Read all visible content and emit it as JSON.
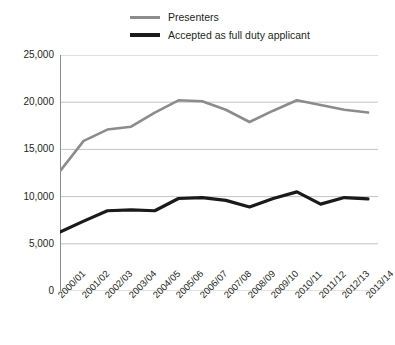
{
  "chart_data": {
    "type": "line",
    "title": "",
    "subtitle": "",
    "xlabel": "",
    "ylabel": "",
    "grid": true,
    "legend_position": "top-center",
    "ylim": [
      0,
      25000
    ],
    "yticks": [
      0,
      5000,
      10000,
      15000,
      20000,
      25000
    ],
    "ytick_labels": [
      "0",
      "5,000",
      "10,000",
      "15,000",
      "20,000",
      "25,000"
    ],
    "categories": [
      "2000/01",
      "2001/02",
      "2002/03",
      "2003/04",
      "2004/05",
      "2005/06",
      "2006/07",
      "2007/08",
      "2008/09",
      "2009/10",
      "2010/11",
      "2011/12",
      "2012/13",
      "2013/14"
    ],
    "series": [
      {
        "name": "Presenters",
        "color": "#8c8c8c",
        "width": 2.6,
        "values": [
          12700,
          15900,
          17100,
          17400,
          18900,
          20200,
          20100,
          19200,
          17900,
          19100,
          20200,
          19700,
          19200,
          18900
        ]
      },
      {
        "name": "Accepted as full duty applicant",
        "color": "#1a1a1a",
        "width": 3.2,
        "values": [
          6250,
          7400,
          8500,
          8600,
          8500,
          9800,
          9900,
          9600,
          8900,
          9800,
          10500,
          9200,
          9900,
          9750
        ]
      }
    ]
  },
  "legend": {
    "items": [
      {
        "label": "Presenters",
        "swatch_class": "presenters"
      },
      {
        "label": "Accepted as full duty applicant",
        "swatch_class": "accepted"
      }
    ]
  },
  "axes": {
    "y_labels": [
      "25,000",
      "20,000",
      "15,000",
      "10,000",
      "5,000",
      "0"
    ],
    "x_labels": [
      "2000/01",
      "2001/02",
      "2002/03",
      "2003/04",
      "2004/05",
      "2005/06",
      "2006/07",
      "2007/08",
      "2008/09",
      "2009/10",
      "2010/11",
      "2011/12",
      "2012/13",
      "2013/14"
    ]
  },
  "colors": {
    "presenters_line": "#8c8c8c",
    "accepted_line": "#1a1a1a",
    "gridline": "#bcbcbc",
    "axis": "#8c8c8c",
    "text": "#231f20"
  }
}
